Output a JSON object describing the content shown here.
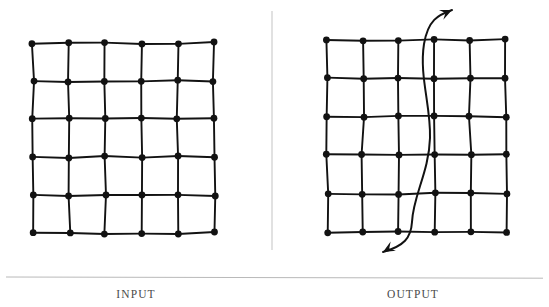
{
  "figure": {
    "background_color": "#ffffff",
    "ink_color": "#121212",
    "rule_color": "#b9b9b9",
    "caption_color": "#4a4a4a",
    "panels": [
      {
        "id": "input",
        "caption": "INPUT",
        "caption_center_x": 128,
        "grid": {
          "rows": 6,
          "cols": 6,
          "cells_x": 5,
          "cells_y": 5,
          "x0": 33,
          "y0": 43,
          "x1": 214,
          "y1": 233,
          "node_radius": 3.4,
          "line_width": 1.9,
          "node_count": 36,
          "edge_count": 60
        },
        "arrow": null
      },
      {
        "id": "output",
        "caption": "OUTPUT",
        "caption_center_x": 445,
        "grid": {
          "rows": 6,
          "cols": 6,
          "cells_x": 5,
          "cells_y": 5,
          "x0": 327,
          "y0": 40,
          "x1": 506,
          "y1": 232,
          "node_radius": 3.4,
          "line_width": 1.9,
          "node_count": 36,
          "edge_count": 60
        },
        "arrow": {
          "name": "double-headed-thread-arrow",
          "description": "S-curve threading vertically through the lattice between columns 3 and 4",
          "stroke_width": 2.0,
          "head_top": {
            "x": 452,
            "y": 10,
            "direction": "up-right"
          },
          "head_bottom": {
            "x": 383,
            "y": 252,
            "direction": "down-left"
          }
        }
      }
    ],
    "divider": {
      "name": "vertical-divider",
      "x": 272,
      "y_top": 11,
      "y_bottom": 250,
      "width": 1
    },
    "baseline_rule": {
      "name": "horizontal-rule",
      "x_left": 6,
      "x_right": 543,
      "y": 277,
      "height": 1
    }
  }
}
